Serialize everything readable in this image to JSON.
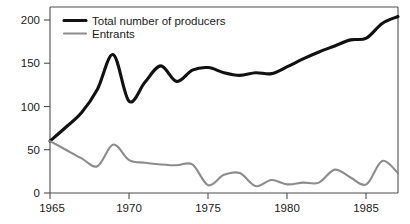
{
  "chart_data": {
    "type": "line",
    "title": "",
    "subtitle": "",
    "xlabel": "",
    "ylabel": "",
    "xlim": [
      1965,
      1987
    ],
    "ylim": [
      0,
      215
    ],
    "grid": false,
    "legend_position": "top-left",
    "yticks": [
      0,
      50,
      100,
      150,
      200
    ],
    "ytick_labels": [
      "0",
      "50",
      "100",
      "150",
      "200"
    ],
    "xticks": [
      1965,
      1970,
      1975,
      1980,
      1985
    ],
    "xtick_labels": [
      "1965",
      "1970",
      "1975",
      "1980",
      "1985"
    ],
    "x": [
      1965,
      1966,
      1967,
      1968,
      1969,
      1970,
      1971,
      1972,
      1973,
      1974,
      1975,
      1976,
      1977,
      1978,
      1979,
      1980,
      1981,
      1982,
      1983,
      1984,
      1985,
      1986,
      1987
    ],
    "series": [
      {
        "name": "Total number of producers",
        "color": "#111111",
        "width": 3.1,
        "values": [
          60,
          76,
          93,
          120,
          160,
          106,
          128,
          147,
          129,
          142,
          145,
          139,
          136,
          139,
          138,
          146,
          155,
          163,
          170,
          177,
          179,
          196,
          204
        ]
      },
      {
        "name": "Entrants",
        "color": "#8c8c8c",
        "width": 2.1,
        "values": [
          60,
          50,
          40,
          31,
          56,
          38,
          35,
          33,
          32,
          33,
          9,
          21,
          23,
          8,
          15,
          10,
          12,
          12,
          27,
          18,
          10,
          37,
          23
        ]
      }
    ],
    "annotations": []
  },
  "legend": {
    "entries": [
      {
        "label": "Total number of producers"
      },
      {
        "label": "Entrants"
      }
    ]
  }
}
